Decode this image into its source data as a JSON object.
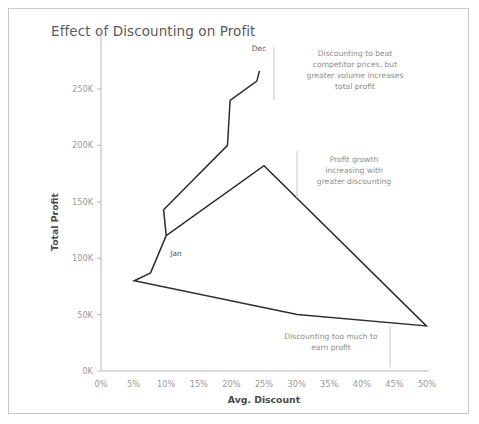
{
  "chart_data": {
    "type": "line",
    "title": "Effect of Discounting on Profit",
    "xlabel": "Avg. Discount",
    "ylabel": "Total Profit",
    "xlim": [
      0,
      50
    ],
    "ylim": [
      0,
      275
    ],
    "xticks": [
      "0%",
      "5%",
      "10%",
      "15%",
      "20%",
      "25%",
      "30%",
      "35%",
      "40%",
      "45%",
      "50%"
    ],
    "xtick_values": [
      0,
      5,
      10,
      15,
      20,
      25,
      30,
      35,
      40,
      45,
      50
    ],
    "yticks": [
      "0K",
      "50K",
      "100K",
      "150K",
      "200K",
      "250K"
    ],
    "ytick_values": [
      0,
      50,
      100,
      150,
      200,
      250
    ],
    "grid": false,
    "legend": "none",
    "series": [
      {
        "name": "Jan to Dec path",
        "points": [
          {
            "x": 10.0,
            "y": 120,
            "label": "Jan"
          },
          {
            "x": 9.6,
            "y": 143,
            "label": ""
          },
          {
            "x": 19.4,
            "y": 200,
            "label": ""
          },
          {
            "x": 19.8,
            "y": 240,
            "label": ""
          },
          {
            "x": 23.9,
            "y": 257,
            "label": ""
          },
          {
            "x": 24.3,
            "y": 266,
            "label": "Dec"
          }
        ]
      },
      {
        "name": "Lower profit loop",
        "points": [
          {
            "x": 10.0,
            "y": 120,
            "label": "Jan"
          },
          {
            "x": 7.6,
            "y": 87,
            "label": ""
          },
          {
            "x": 5.1,
            "y": 80,
            "label": ""
          },
          {
            "x": 30.1,
            "y": 50,
            "label": ""
          },
          {
            "x": 49.9,
            "y": 40,
            "label": ""
          },
          {
            "x": 25.0,
            "y": 182,
            "label": ""
          },
          {
            "x": 10.0,
            "y": 120,
            "label": "Jan"
          }
        ]
      }
    ],
    "point_labels": [
      {
        "text": "Dec",
        "x": 24.3,
        "y": 266
      },
      {
        "text": "Jan",
        "x": 10.0,
        "y": 120
      }
    ],
    "annotations": [
      {
        "id": "annotation-discount-beat-competitor",
        "lines": [
          "Discounting to beat",
          "competitor prices, but",
          "greater volume increases",
          "total profit"
        ],
        "rule_side": "left"
      },
      {
        "id": "annotation-profit-growth",
        "lines": [
          "Profit growth",
          "increasing with",
          "greater discounting"
        ],
        "rule_side": "left"
      },
      {
        "id": "annotation-too-much-discount",
        "lines": [
          "Discounting too much to",
          "earn profit"
        ],
        "rule_side": "right"
      }
    ],
    "colors": {
      "line": "#2e2e2e",
      "axis": "#b8b8b8",
      "tick_text": "#9a9a9a",
      "title_text": "#5a5a5a",
      "annotation_text": "#8d8d8d",
      "frame_border": "#c9c9c9",
      "background": "#ffffff"
    }
  }
}
